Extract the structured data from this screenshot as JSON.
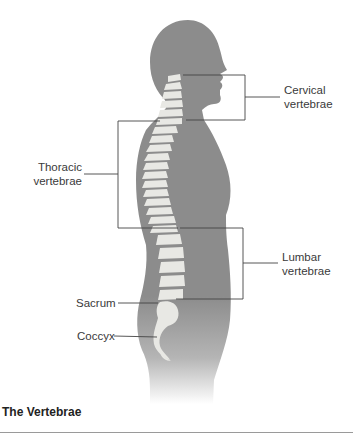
{
  "figure": {
    "title": "The Vertebrae",
    "colors": {
      "silhouette": "#8c8c8c",
      "bone": "#e8e8e4",
      "leader_line": "#444444"
    },
    "labels": {
      "cervical": [
        "Cervical",
        "vertebrae"
      ],
      "thoracic": [
        "Thoracic",
        "vertebrae"
      ],
      "lumbar": [
        "Lumbar",
        "vertebrae"
      ],
      "sacrum": "Sacrum",
      "coccyx": "Coccyx"
    }
  }
}
